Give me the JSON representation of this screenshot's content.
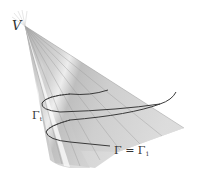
{
  "figure": {
    "labels": {
      "vertex": "V",
      "curve_t": {
        "symbol": "Γ",
        "subscript": "t"
      },
      "curve_1": {
        "lhs": "Γ = Γ",
        "subscript": "1"
      }
    },
    "colors": {
      "surface_light": "#e6e6e6",
      "surface_mid": "#c8c8c8",
      "surface_dark": "#a8a8a8",
      "curve": "#3a3a3a",
      "rulings": "#9a9a9a",
      "label": "#333333"
    }
  }
}
